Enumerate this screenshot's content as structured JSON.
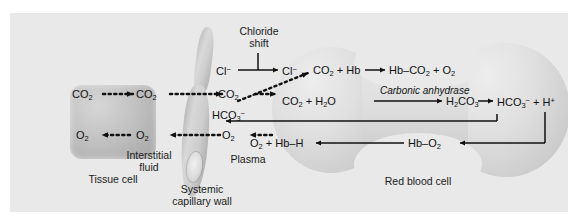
{
  "diagram": {
    "structures": {
      "tissue_cell": "Tissue cell",
      "interstitial_fluid_line1": "Interstitial",
      "interstitial_fluid_line2": "fluid",
      "capillary_wall_line1": "Systemic",
      "capillary_wall_line2": "capillary wall",
      "plasma": "Plasma",
      "red_blood_cell": "Red blood cell"
    },
    "annotations": {
      "chloride_shift_line1": "Chloride",
      "chloride_shift_line2": "shift",
      "enzyme": "Carbonic anhydrase"
    },
    "species": {
      "co2_tissue": "CO2",
      "co2_interstitial": "CO2",
      "co2_plasma": "CO2",
      "o2_tissue": "O2",
      "o2_interstitial": "O2",
      "o2_plasma": "O2",
      "cl_plasma": "Cl−",
      "cl_rbc": "Cl−",
      "hco3_plasma": "HCO3−"
    },
    "reactions": {
      "carbamino": "CO2 + Hb → Hb–CO2 + O2",
      "hydration_left": "CO2 + H2O",
      "carbonic_acid": "H2CO3",
      "bicarbonate": "HCO3− + H+",
      "oxyhemoglobin_release": "O2 + Hb–H",
      "hb_o2": "Hb–O2"
    },
    "colors": {
      "panel_background": "#e9e9e9",
      "page_background": "#ffffff",
      "cell_fill": "#cfcfcf",
      "text": "#1a1a1a",
      "arrow": "#111111"
    }
  }
}
